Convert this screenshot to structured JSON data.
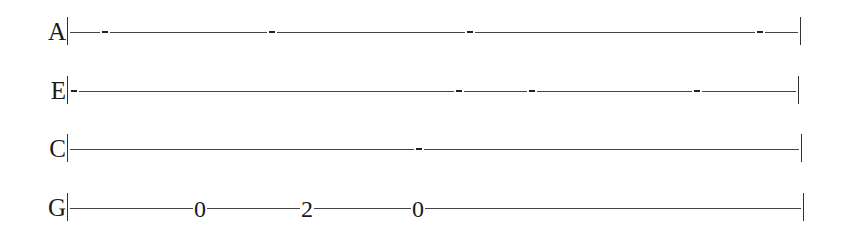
{
  "tablature": {
    "strings": [
      {
        "name": "A",
        "y": 32,
        "right_x": 800,
        "marks": [
          105,
          272,
          470,
          760
        ],
        "frets": []
      },
      {
        "name": "E",
        "y": 91,
        "right_x": 798,
        "marks": [
          74,
          459,
          532,
          697
        ],
        "frets": []
      },
      {
        "name": "C",
        "y": 149,
        "right_x": 801,
        "marks": [
          419
        ],
        "frets": []
      },
      {
        "name": "G",
        "y": 208,
        "right_x": 803,
        "marks": [],
        "frets": [
          {
            "value": "0",
            "x": 200
          },
          {
            "value": "2",
            "x": 307
          },
          {
            "value": "0",
            "x": 418
          }
        ]
      }
    ]
  }
}
